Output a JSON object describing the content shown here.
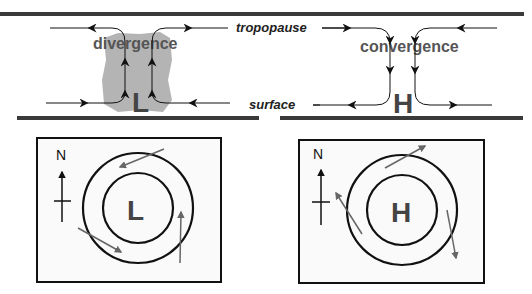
{
  "labels": {
    "tropopause": "tropopause",
    "surface": "surface",
    "divergence": "divergence",
    "convergence": "convergence",
    "low": "L",
    "high": "H",
    "north": "N"
  },
  "colors": {
    "bar": "#3a3a3a",
    "line": "#111111",
    "cloud": "#b4b4b4",
    "wind_arrow": "#666666",
    "box_fill": "#fafafa"
  },
  "panels": {
    "vertical_low": {
      "flow": "surface convergence, rising air, upper divergence",
      "center_label": "L"
    },
    "vertical_high": {
      "flow": "upper convergence, sinking air, surface divergence",
      "center_label": "H"
    },
    "plan_low": {
      "center_label": "L",
      "rotation": "counterclockwise",
      "has_north_arrow": true
    },
    "plan_high": {
      "center_label": "H",
      "rotation": "clockwise",
      "has_north_arrow": true
    }
  }
}
